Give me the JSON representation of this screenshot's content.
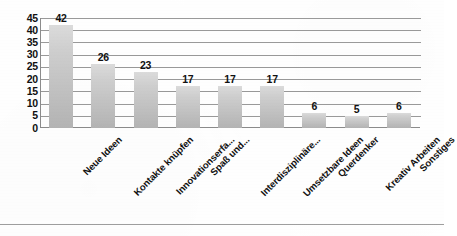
{
  "chart_data": {
    "type": "bar",
    "title": "",
    "subtitle": "",
    "xlabel": "",
    "ylabel": "",
    "categories": [
      "Neue Ideen",
      "Kontakte knüpfen",
      "Innovationserfa...",
      "Spaß und...",
      "Interdisziplinäre...",
      "Umsetzbare Ideen",
      "Querdenker",
      "Kreativ Arbeiten",
      "Sonstiges"
    ],
    "values": [
      42,
      26,
      23,
      17,
      17,
      17,
      6,
      5,
      6
    ],
    "data_labels": [
      "42",
      "26",
      "23",
      "17",
      "17",
      "17",
      "6",
      "5",
      "6"
    ],
    "ylim": [
      0,
      45
    ],
    "ytick_labels": [
      "45",
      "40",
      "35",
      "30",
      "25",
      "20",
      "15",
      "10",
      "5",
      "0"
    ],
    "ytick_values": [
      45,
      40,
      35,
      30,
      25,
      20,
      15,
      10,
      5,
      0
    ],
    "ytick_step": 5,
    "grid": true,
    "grid_axis": "y",
    "legend": false,
    "legend_position": "none",
    "bar_color_top": "#dcdcdc",
    "bar_color_bottom": "#b4b4b4",
    "gridline_color": "#9a9a9a",
    "axis_color": "#8c8c8c",
    "text_color": "#111111",
    "background_color": "#ffffff"
  }
}
